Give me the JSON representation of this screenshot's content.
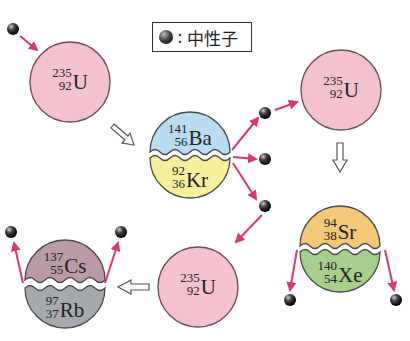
{
  "legend": {
    "icon": "neutron-icon",
    "separator": ":",
    "label": "中性子"
  },
  "colors": {
    "uranium": "#f4c2cf",
    "barium": "#b9dcf0",
    "krypton": "#f7ef9c",
    "strontium": "#f3c877",
    "xenon": "#a6cf8c",
    "cesium": "#b99aa6",
    "rubidium": "#a6a9ae",
    "arrow": "#e0366a"
  },
  "nuclei": {
    "u1": {
      "mass": "235",
      "atomic": "92",
      "symbol": "U"
    },
    "u2": {
      "mass": "235",
      "atomic": "92",
      "symbol": "U"
    },
    "u3": {
      "mass": "235",
      "atomic": "92",
      "symbol": "U"
    },
    "ba": {
      "mass": "141",
      "atomic": "56",
      "symbol": "Ba"
    },
    "kr": {
      "mass": "92",
      "atomic": "36",
      "symbol": "Kr"
    },
    "sr": {
      "mass": "94",
      "atomic": "38",
      "symbol": "Sr"
    },
    "xe": {
      "mass": "140",
      "atomic": "54",
      "symbol": "Xe"
    },
    "cs": {
      "mass": "137",
      "atomic": "55",
      "symbol": "Cs"
    },
    "rb": {
      "mass": "97",
      "atomic": "37",
      "symbol": "Rb"
    }
  }
}
